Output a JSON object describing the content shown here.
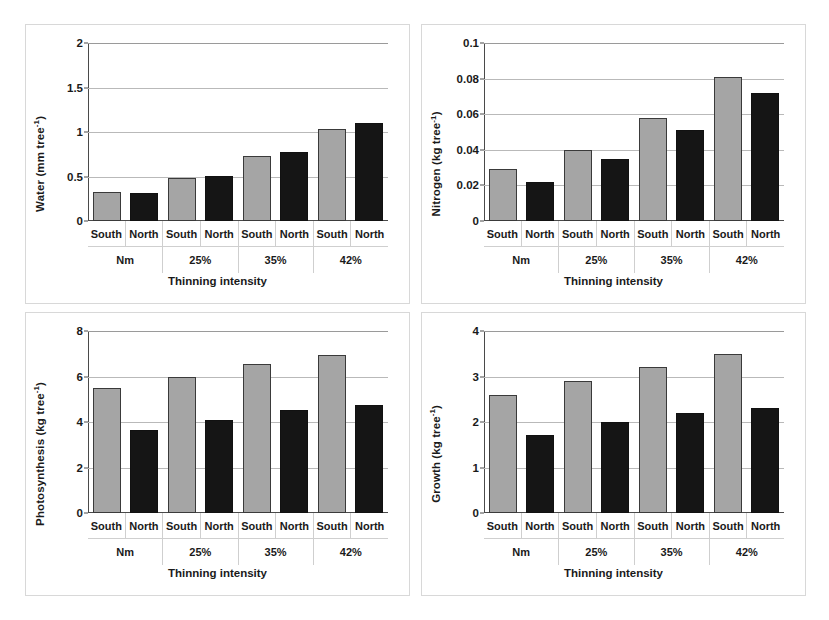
{
  "figure": {
    "background": "#ffffff",
    "series_colors": {
      "south": "#a5a5a5",
      "north": "#151515"
    },
    "group_labels": [
      "Nm",
      "25%",
      "35%",
      "42%"
    ],
    "exposure_labels": [
      "South",
      "North"
    ],
    "xlabel": "Thinning intensity"
  },
  "chart_data": [
    {
      "type": "bar",
      "panel": "top-left",
      "title": "",
      "ylabel": "Water (mm tree-1)",
      "ylabel_base": "Water (mm tree",
      "ylabel_sup": "-1",
      "ylabel_tail": ")",
      "xlabel": "Thinning intensity",
      "categories": [
        "Nm",
        "25%",
        "35%",
        "42%"
      ],
      "subcategories": [
        "South",
        "North"
      ],
      "bar_labels": [
        "South",
        "North",
        "South",
        "North",
        "South",
        "North",
        "South",
        "North"
      ],
      "values": [
        0.33,
        0.31,
        0.48,
        0.51,
        0.73,
        0.78,
        1.03,
        1.1
      ],
      "series": [
        {
          "name": "South",
          "values": [
            0.33,
            0.48,
            0.73,
            1.03
          ]
        },
        {
          "name": "North",
          "values": [
            0.31,
            0.51,
            0.78,
            1.1
          ]
        }
      ],
      "ylim": [
        0,
        2
      ],
      "yticks": [
        0,
        0.5,
        1,
        1.5,
        2
      ],
      "ytick_labels": [
        "0",
        "0.5",
        "1",
        "1.5",
        "2"
      ],
      "grid": true,
      "legend": "none"
    },
    {
      "type": "bar",
      "panel": "top-right",
      "title": "",
      "ylabel": "Nitrogen (kg tree-1)",
      "ylabel_base": "Nitrogen (kg tree",
      "ylabel_sup": "-1",
      "ylabel_tail": ")",
      "xlabel": "Thinning intensity",
      "categories": [
        "Nm",
        "25%",
        "35%",
        "42%"
      ],
      "subcategories": [
        "South",
        "North"
      ],
      "bar_labels": [
        "South",
        "North",
        "South",
        "North",
        "South",
        "North",
        "South",
        "North"
      ],
      "values": [
        0.029,
        0.022,
        0.04,
        0.035,
        0.058,
        0.051,
        0.081,
        0.072
      ],
      "series": [
        {
          "name": "South",
          "values": [
            0.029,
            0.04,
            0.058,
            0.081
          ]
        },
        {
          "name": "North",
          "values": [
            0.022,
            0.035,
            0.051,
            0.072
          ]
        }
      ],
      "ylim": [
        0,
        0.1
      ],
      "yticks": [
        0,
        0.02,
        0.04,
        0.06,
        0.08,
        0.1
      ],
      "ytick_labels": [
        "0",
        "0.02",
        "0.04",
        "0.06",
        "0.08",
        "0.1"
      ],
      "grid": true,
      "legend": "none"
    },
    {
      "type": "bar",
      "panel": "bottom-left",
      "title": "",
      "ylabel": "Photosynthesis (kg tree-1)",
      "ylabel_base": "Photosynthesis (kg tree",
      "ylabel_sup": "-1",
      "ylabel_tail": ")",
      "xlabel": "Thinning intensity",
      "categories": [
        "Nm",
        "25%",
        "35%",
        "42%"
      ],
      "subcategories": [
        "South",
        "North"
      ],
      "bar_labels": [
        "South",
        "North",
        "South",
        "North",
        "South",
        "North",
        "South",
        "North"
      ],
      "values": [
        5.5,
        3.65,
        6.0,
        4.1,
        6.55,
        4.55,
        6.95,
        4.75
      ],
      "series": [
        {
          "name": "South",
          "values": [
            5.5,
            6.0,
            6.55,
            6.95
          ]
        },
        {
          "name": "North",
          "values": [
            3.65,
            4.1,
            4.55,
            4.75
          ]
        }
      ],
      "ylim": [
        0,
        8
      ],
      "yticks": [
        0,
        2,
        4,
        6,
        8
      ],
      "ytick_labels": [
        "0",
        "2",
        "4",
        "6",
        "8"
      ],
      "grid": true,
      "legend": "none"
    },
    {
      "type": "bar",
      "panel": "bottom-right",
      "title": "",
      "ylabel": "Growth (kg tree-1)",
      "ylabel_base": "Growth (kg tree",
      "ylabel_sup": "-1",
      "ylabel_tail": ")",
      "xlabel": "Thinning intensity",
      "categories": [
        "Nm",
        "25%",
        "35%",
        "42%"
      ],
      "subcategories": [
        "South",
        "North"
      ],
      "bar_labels": [
        "South",
        "North",
        "South",
        "North",
        "South",
        "North",
        "South",
        "North"
      ],
      "values": [
        2.6,
        1.72,
        2.9,
        2.0,
        3.2,
        2.2,
        3.5,
        2.3
      ],
      "series": [
        {
          "name": "South",
          "values": [
            2.6,
            2.9,
            3.2,
            3.5
          ]
        },
        {
          "name": "North",
          "values": [
            1.72,
            2.0,
            2.2,
            2.3
          ]
        }
      ],
      "ylim": [
        0,
        4
      ],
      "yticks": [
        0,
        1,
        2,
        3,
        4
      ],
      "ytick_labels": [
        "0",
        "1",
        "2",
        "3",
        "4"
      ],
      "grid": true,
      "legend": "none"
    }
  ]
}
